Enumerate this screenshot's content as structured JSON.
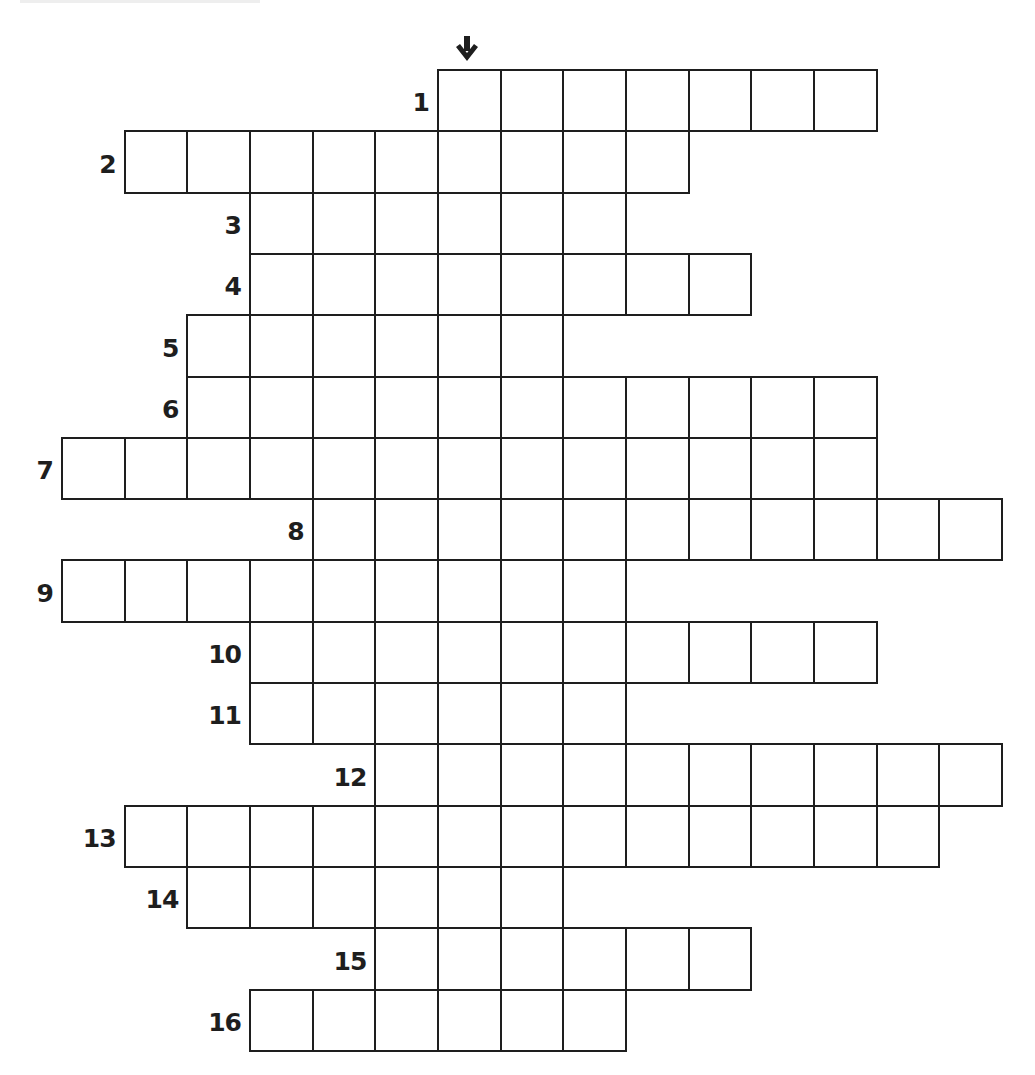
{
  "puzzle": {
    "type": "crossword",
    "grid": {
      "origin_x": 61,
      "origin_y": 69,
      "cell_w": 62.67,
      "cell_h": 61.3,
      "columns": 15,
      "rows": 16
    },
    "arrow": {
      "icon": "arrow-down-icon",
      "glyph": "🡇",
      "column": 6,
      "label": ""
    },
    "solution_column": 6,
    "line_color": "#1e1e1e",
    "background": "#ffffff",
    "entries": [
      {
        "number": "1",
        "start_col": 6,
        "length": 7
      },
      {
        "number": "2",
        "start_col": 1,
        "length": 9
      },
      {
        "number": "3",
        "start_col": 3,
        "length": 6
      },
      {
        "number": "4",
        "start_col": 3,
        "length": 8
      },
      {
        "number": "5",
        "start_col": 2,
        "length": 6
      },
      {
        "number": "6",
        "start_col": 2,
        "length": 11
      },
      {
        "number": "7",
        "start_col": 0,
        "length": 13
      },
      {
        "number": "8",
        "start_col": 4,
        "length": 11
      },
      {
        "number": "9",
        "start_col": 0,
        "length": 9
      },
      {
        "number": "10",
        "start_col": 3,
        "length": 10
      },
      {
        "number": "11",
        "start_col": 3,
        "length": 6
      },
      {
        "number": "12",
        "start_col": 5,
        "length": 10
      },
      {
        "number": "13",
        "start_col": 1,
        "length": 13
      },
      {
        "number": "14",
        "start_col": 2,
        "length": 6
      },
      {
        "number": "15",
        "start_col": 5,
        "length": 6
      },
      {
        "number": "16",
        "start_col": 3,
        "length": 6
      }
    ]
  }
}
